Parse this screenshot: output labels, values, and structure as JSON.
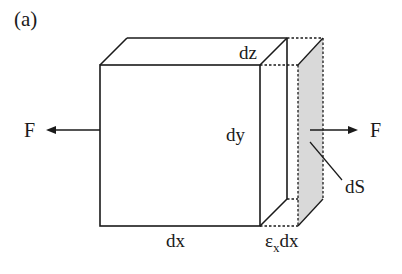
{
  "figure": {
    "panel_label": "(a)",
    "labels": {
      "force_left": "F",
      "force_right": "F",
      "depth": "dz",
      "height": "dy",
      "width": "dx",
      "elongation_symbol": "ε",
      "elongation_subscript": "x",
      "elongation_suffix": "dx",
      "surface": "dS"
    },
    "colors": {
      "line": "#1a1a1a",
      "shaded_face": "#d9d9d9",
      "background": "#ffffff"
    }
  }
}
